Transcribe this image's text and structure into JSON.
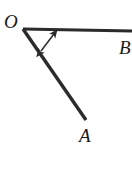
{
  "figure": {
    "type": "geometry-angle-diagram",
    "background_color": "#ffffff",
    "stroke_color": "#2b2b2b",
    "label_color": "#1a1a1a"
  },
  "labels": {
    "vertex": "O",
    "ray_a_endpoint": "A",
    "ray_b_endpoint": "B"
  },
  "geometry": {
    "vertex_point": {
      "x": 23,
      "y": 29
    },
    "ray_ob": {
      "name": "ray-OB",
      "from": {
        "x": 23,
        "y": 29
      },
      "to": {
        "x": 132,
        "y": 31
      },
      "stroke_width": 3.2,
      "clipped_at_right_edge": true
    },
    "ray_oa": {
      "name": "ray-OA",
      "from": {
        "x": 23,
        "y": 29
      },
      "to": {
        "x": 86,
        "y": 120
      },
      "stroke_width": 3.4
    },
    "angle_marker": {
      "name": "double-headed-arrow",
      "from": {
        "x": 41,
        "y": 51
      },
      "to": {
        "x": 57,
        "y": 30
      },
      "stroke_width": 1.5,
      "arrowheads": "both"
    }
  },
  "label_positions": {
    "O": {
      "x": 4,
      "y": 28,
      "font_size": 19
    },
    "A": {
      "x": 79,
      "y": 142,
      "font_size": 19
    },
    "B": {
      "x": 119,
      "y": 54,
      "font_size": 19
    }
  }
}
